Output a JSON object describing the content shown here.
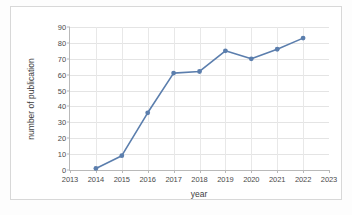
{
  "chart_data": {
    "type": "line",
    "title": "",
    "xlabel": "year",
    "ylabel": "number of publication",
    "xlim": [
      2013,
      2023
    ],
    "ylim": [
      0,
      90
    ],
    "grid": true,
    "legend": "none",
    "xticks": [
      "2013",
      "2014",
      "2015",
      "2016",
      "2017",
      "2018",
      "2019",
      "2020",
      "2021",
      "2022",
      "2023"
    ],
    "yticks": [
      "0",
      "10",
      "20",
      "30",
      "40",
      "50",
      "60",
      "70",
      "80",
      "90"
    ],
    "series": [
      {
        "name": "number of publication",
        "color": "#5b7ead",
        "marker": "circle",
        "x": [
          2014,
          2015,
          2016,
          2017,
          2018,
          2019,
          2020,
          2021,
          2022
        ],
        "values": [
          1,
          9,
          36,
          61,
          62,
          75,
          70,
          76,
          83
        ]
      }
    ]
  },
  "axes": {
    "x_title": "year",
    "y_title": "number of publication"
  },
  "style": {
    "accent": "#5b7ead",
    "grid_color": "#e4e4e4",
    "axis_color": "#b9b9b9",
    "text_color": "#4a4a4a",
    "frame_color": "#d8d8d8",
    "background": "#ffffff"
  }
}
